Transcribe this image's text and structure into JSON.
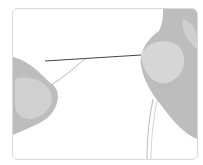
{
  "image": {
    "description": "Illustration of two hands threading a needle",
    "colors": {
      "frame": "#d9d9d9",
      "skin": "#bdbdbd",
      "skin_light": "#d6d6d6",
      "needle": "#444444",
      "thread": "#a8a8a8"
    }
  }
}
